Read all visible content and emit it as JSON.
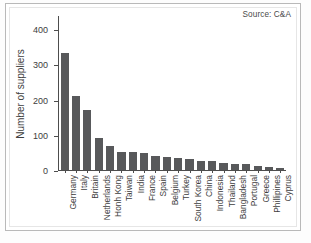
{
  "source_note": "Source: C&A",
  "chart_data": {
    "type": "bar",
    "title": "",
    "subtitle": "",
    "xlabel": "",
    "ylabel": "Number of suppliers",
    "ylim": [
      0,
      440
    ],
    "yticks": [
      0,
      100,
      200,
      300,
      400
    ],
    "ytick_labels": [
      "0",
      "100",
      "200",
      "300",
      "400"
    ],
    "grid": false,
    "legend": false,
    "bar_color": "#58595b",
    "annotations": [
      "Source: C&A"
    ],
    "categories": [
      "Germany",
      "Italy",
      "Britain",
      "Netherlands",
      "Honh Kong",
      "Taiwan",
      "India",
      "France",
      "Spain",
      "Belgium",
      "Turkey",
      "South Korea",
      "China",
      "Indonesia",
      "Thailand",
      "Bangladesh",
      "Portugal",
      "Greece",
      "Phillipines",
      "Cyprus"
    ],
    "values": [
      332,
      211,
      171,
      91,
      67,
      51,
      51,
      48,
      41,
      38,
      35,
      30,
      26,
      25,
      19,
      18,
      16,
      12,
      9,
      6
    ]
  }
}
